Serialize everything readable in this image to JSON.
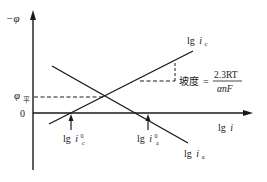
{
  "diagram": {
    "type": "polarization-curves",
    "y_axis_label": "−φ",
    "x_axis_label_prefix": "lg",
    "x_axis_label_var": "i",
    "equilibrium_label_main": "φ",
    "equilibrium_label_sub": "平",
    "zero_label": "0",
    "cathodic_curve": {
      "label_prefix": "lg",
      "label_var": "i",
      "label_sub": "c"
    },
    "anodic_curve": {
      "label_prefix": "lg",
      "label_var": "i",
      "label_sub": "a"
    },
    "cathodic_exchange": {
      "label_prefix": "lg",
      "label_var": "i",
      "label_sup": "0",
      "label_sub": "c"
    },
    "anodic_exchange": {
      "label_prefix": "lg",
      "label_var": "i",
      "label_sup": "0",
      "label_sub": "a"
    },
    "slope_annotation": {
      "label": "坡度",
      "equals": "=",
      "numerator": "2.3RT",
      "denominator": "αnF"
    },
    "colors": {
      "line": "#1a1a1a",
      "background": "#ffffff"
    }
  }
}
